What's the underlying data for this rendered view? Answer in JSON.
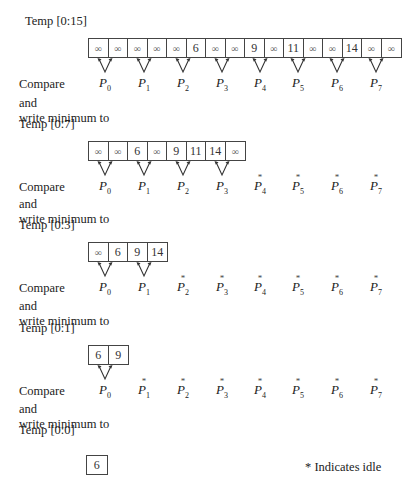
{
  "stages": [
    {
      "title": "Temp [0:15]",
      "cells": [
        "∞",
        "∞",
        "∞",
        "∞",
        "∞",
        "6",
        "∞",
        "∞",
        "9",
        "∞",
        "11",
        "∞",
        "∞",
        "14",
        "∞",
        "∞"
      ],
      "active_processors": [
        0,
        1,
        2,
        3,
        4,
        5,
        6,
        7
      ]
    },
    {
      "title": "Temp [0:7]",
      "cells": [
        "∞",
        "∞",
        "6",
        "∞",
        "9",
        "11",
        "14",
        "∞"
      ],
      "active_processors": [
        0,
        1,
        2,
        3
      ]
    },
    {
      "title": "Temp [0:3]",
      "cells": [
        "∞",
        "6",
        "9",
        "14"
      ],
      "active_processors": [
        0,
        1
      ]
    },
    {
      "title": "Temp [0:1]",
      "cells": [
        "6",
        "9"
      ],
      "active_processors": [
        0
      ]
    },
    {
      "title": "Temp [0:0]",
      "cells": [
        "6"
      ],
      "active_processors": []
    }
  ],
  "labels": {
    "compare": "Compare",
    "and": "and",
    "write_min": "write minimum to"
  },
  "processors": [
    "P",
    "P",
    "P",
    "P",
    "P",
    "P",
    "P",
    "P"
  ],
  "processor_indices": [
    "0",
    "1",
    "2",
    "3",
    "4",
    "5",
    "6",
    "7"
  ],
  "idle_marker": "*",
  "legend": "* Indicates idle"
}
